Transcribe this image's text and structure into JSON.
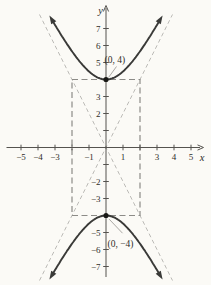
{
  "figure": {
    "width": 211,
    "height": 285,
    "colors": {
      "background": "#fbfaf6",
      "axis": "#55534f",
      "curve": "#3a3a38",
      "asymptote": "#bcbbb7",
      "central_box": "#8c8b87",
      "text": "#2f2d29",
      "leader": "#a09e9a",
      "vertex_point": "#181815"
    }
  },
  "chart_data": {
    "type": "line",
    "equation": "y²/16 − x²/4 = 1",
    "xlabel": "x",
    "ylabel": "y",
    "xlim": [
      -5.9,
      5.9
    ],
    "ylim": [
      -8.3,
      8.3
    ],
    "grid": false,
    "legend": "none",
    "hyperbola": {
      "a": 4,
      "b": 2,
      "orientation": "vertical",
      "center": [
        0,
        0
      ]
    },
    "vertices": [
      {
        "x": 0,
        "y": 4,
        "label": "(0, 4)"
      },
      {
        "x": 0,
        "y": -4,
        "label": "(0, −4)"
      }
    ],
    "asymptotes": [
      {
        "equation": "y = 2x",
        "slope": 2
      },
      {
        "equation": "y = −2x",
        "slope": -2
      }
    ],
    "central_box": {
      "x_range": [
        -2,
        2
      ],
      "y_range": [
        -4,
        4
      ]
    },
    "x_ticks": [
      {
        "v": -5,
        "label": "−5"
      },
      {
        "v": -4,
        "label": "−4"
      },
      {
        "v": -3,
        "label": "−3"
      },
      {
        "v": -2,
        "label": ""
      },
      {
        "v": -1,
        "label": "−1"
      },
      {
        "v": 1,
        "label": "1"
      },
      {
        "v": 2,
        "label": ""
      },
      {
        "v": 3,
        "label": "3"
      },
      {
        "v": 4,
        "label": "4"
      },
      {
        "v": 5,
        "label": "5"
      }
    ],
    "y_ticks": [
      {
        "v": 7,
        "label": "7"
      },
      {
        "v": 6,
        "label": "6"
      },
      {
        "v": 5,
        "label": "5"
      },
      {
        "v": 4,
        "label": ""
      },
      {
        "v": 3,
        "label": "3"
      },
      {
        "v": 2,
        "label": "2"
      },
      {
        "v": 1,
        "label": ""
      },
      {
        "v": -1,
        "label": ""
      },
      {
        "v": -2,
        "label": "−2"
      },
      {
        "v": -3,
        "label": "−3"
      },
      {
        "v": -4,
        "label": ""
      },
      {
        "v": -5,
        "label": "−5"
      },
      {
        "v": -6,
        "label": "−6"
      },
      {
        "v": -7,
        "label": "−7"
      }
    ],
    "series": [
      {
        "name": "upper branch",
        "equation": "y = 2√(4 + x²)",
        "points": [
          [
            -3,
            7.21
          ],
          [
            -2,
            5.66
          ],
          [
            -1,
            4.47
          ],
          [
            0,
            4
          ],
          [
            1,
            4.47
          ],
          [
            2,
            5.66
          ],
          [
            3,
            7.21
          ]
        ]
      },
      {
        "name": "lower branch",
        "equation": "y = −2√(4 + x²)",
        "points": [
          [
            -3,
            -7.21
          ],
          [
            -2,
            -5.66
          ],
          [
            -1,
            -4.47
          ],
          [
            0,
            -4
          ],
          [
            1,
            -4.47
          ],
          [
            2,
            -5.66
          ],
          [
            3,
            -7.21
          ]
        ]
      }
    ]
  }
}
